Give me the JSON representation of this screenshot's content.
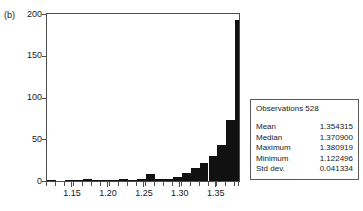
{
  "figure": {
    "panel_label": "(b)"
  },
  "stats": {
    "observations_label": "Observations 528",
    "rows": [
      {
        "key": "Mean",
        "value": "1.354315"
      },
      {
        "key": "Median",
        "value": "1.370900"
      },
      {
        "key": "Maximum",
        "value": "1.380919"
      },
      {
        "key": "Minimum",
        "value": "1.122496"
      },
      {
        "key": "Std dev.",
        "value": "0.041334"
      }
    ]
  },
  "chart_data": {
    "type": "bar",
    "title": "",
    "subtitle": "",
    "xlabel": "",
    "ylabel": "",
    "grid": false,
    "legend": null,
    "bar_style": "histogram",
    "bar_color": "#111111",
    "xlim": [
      1.115,
      1.3825
    ],
    "ylim": [
      0,
      200
    ],
    "xticks": [
      1.15,
      1.2,
      1.25,
      1.3,
      1.35
    ],
    "xtick_labels": [
      "1.15",
      "1.20",
      "1.25",
      "1.30",
      "1.35"
    ],
    "xminor_step": 0.0125,
    "yticks": [
      0,
      50,
      100,
      150,
      200
    ],
    "ytick_labels": [
      "0",
      "50",
      "100",
      "150",
      "200"
    ],
    "bin_width": 0.0125,
    "bin_edges": [
      1.115,
      1.1275,
      1.14,
      1.1525,
      1.165,
      1.1775,
      1.19,
      1.2025,
      1.215,
      1.2275,
      1.24,
      1.2525,
      1.265,
      1.2775,
      1.29,
      1.3025,
      1.315,
      1.3275,
      1.34,
      1.3525,
      1.365,
      1.3775,
      1.3825
    ],
    "bin_centers": [
      1.1213,
      1.1338,
      1.1463,
      1.1588,
      1.1713,
      1.1838,
      1.1963,
      1.2088,
      1.2213,
      1.2338,
      1.2463,
      1.2588,
      1.2713,
      1.2838,
      1.2963,
      1.3088,
      1.3213,
      1.3338,
      1.3463,
      1.3588,
      1.3713,
      1.38
    ],
    "values": [
      1,
      0,
      1,
      1,
      3,
      1,
      1,
      1,
      2,
      1,
      2,
      8,
      3,
      3,
      5,
      10,
      15,
      22,
      30,
      43,
      73,
      193
    ],
    "annotations": [
      "(b)"
    ]
  }
}
